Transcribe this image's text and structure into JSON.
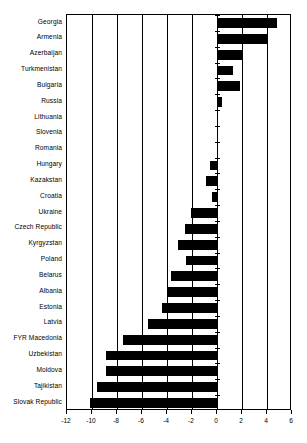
{
  "chart_data": {
    "type": "bar",
    "orientation": "horizontal",
    "title": "",
    "subtitle": "",
    "xlabel": "",
    "ylabel": "",
    "xlim": [
      -12,
      6
    ],
    "xticks": [
      -12,
      -10,
      -8,
      -6,
      -4,
      -2,
      0,
      2,
      4,
      6
    ],
    "xtick_labels": [
      "-12",
      "-10",
      "-8",
      "-6",
      "-4",
      "-2",
      "0",
      "2",
      "4",
      "6"
    ],
    "grid": true,
    "grid_axis": "x",
    "legend": null,
    "bar_color": "#000000",
    "background_color": "#ffffff",
    "axis_color": "#000000",
    "categories": [
      "Georgia",
      "Armenia",
      "Azerbaijan",
      "Turkmenistan",
      "Bulgaria",
      "Russia",
      "Lithuania",
      "Slovenia",
      "Romania",
      "Hungary",
      "Kazakstan",
      "Croatia",
      "Ukraine",
      "Czech Republic",
      "Kyrgyzstan",
      "Poland",
      "Belarus",
      "Albania",
      "Estonia",
      "Latvia",
      "FYR Macedonia",
      "Uzbekistan",
      "Moldova",
      "Tajikistan",
      "Slovak Republic"
    ],
    "values": [
      4.8,
      4.0,
      2.0,
      1.3,
      1.8,
      0.4,
      0.0,
      0.0,
      0.0,
      -0.6,
      -0.9,
      -0.4,
      -2.1,
      -2.6,
      -3.1,
      -2.5,
      -3.7,
      -4.0,
      -4.4,
      -5.5,
      -7.5,
      -8.9,
      -8.9,
      -9.6,
      -10.2
    ]
  }
}
